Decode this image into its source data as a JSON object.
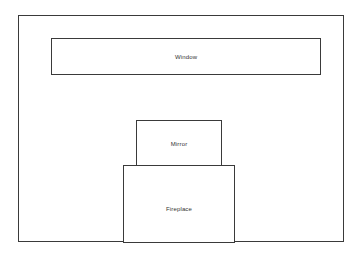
{
  "diagram": {
    "type": "elevation-diagram",
    "background_color": "#ffffff",
    "stroke_color": "#3a3a3a",
    "text_color": "#333333",
    "shapes": [
      {
        "id": "room",
        "label": "",
        "x": 18,
        "y": 15,
        "width": 326,
        "height": 227
      },
      {
        "id": "window",
        "label": "Window",
        "x": 51,
        "y": 38,
        "width": 270,
        "height": 37
      },
      {
        "id": "mirror",
        "label": "Mirror",
        "x": 136,
        "y": 120,
        "width": 86,
        "height": 50
      },
      {
        "id": "fireplace",
        "label": "Fireplace",
        "x": 123,
        "y": 165,
        "width": 112,
        "height": 78
      }
    ]
  }
}
